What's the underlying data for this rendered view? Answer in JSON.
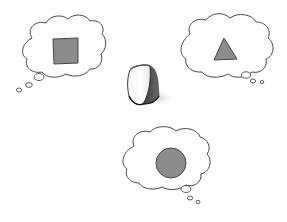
{
  "scene": {
    "description": "Illustration of an object (a rounded 3D shape) with three thought bubbles, each imagining a different 2D shape",
    "background": "#ffffff",
    "outline_color": "#333333",
    "shape_fill": "#8c8c8c",
    "object": {
      "name": "curved-wedge-object",
      "label": "3D object"
    },
    "thought_bubbles": [
      {
        "position": "top-left",
        "shape": "square",
        "label": "square"
      },
      {
        "position": "top-right",
        "shape": "triangle",
        "label": "triangle"
      },
      {
        "position": "bottom-center",
        "shape": "circle",
        "label": "circle"
      }
    ]
  }
}
